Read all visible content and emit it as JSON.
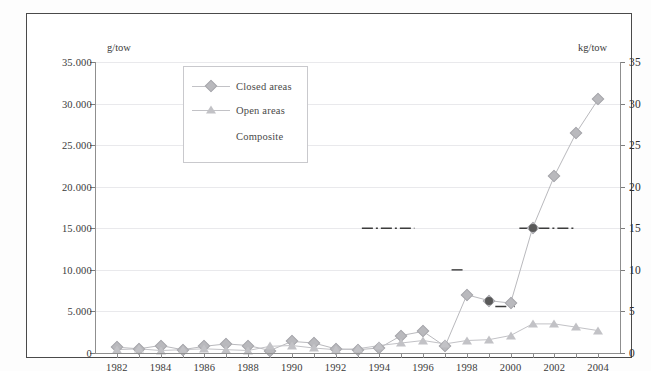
{
  "axes": {
    "left_unit": "g/tow",
    "right_unit": "kg/tow",
    "left_ticks": [
      "35.000",
      "30.000",
      "25.000",
      "20.000",
      "15.000",
      "10.000",
      "5.000",
      "0"
    ],
    "right_ticks": [
      "35",
      "30",
      "25",
      "20",
      "15",
      "10",
      "5",
      "0"
    ],
    "x_labels": [
      "1982",
      "1984",
      "1986",
      "1988",
      "1990",
      "1992",
      "1994",
      "1996",
      "1998",
      "2000",
      "2002",
      "2004"
    ]
  },
  "legend": {
    "position": "upper-left-inset",
    "items": [
      {
        "label": "Closed areas",
        "marker": "diamond",
        "color": "#b9b9bd"
      },
      {
        "label": "Open areas",
        "marker": "triangle",
        "color": "#c2c2c6"
      },
      {
        "label": "Composite",
        "marker": "dash-dot-line",
        "color": "#3c3c3c"
      }
    ]
  },
  "chart_data": {
    "type": "line",
    "title": "",
    "xlabel": "",
    "ylabel": "g/tow",
    "y2label": "kg/tow",
    "xlim": [
      1981,
      2005
    ],
    "ylim": [
      0,
      35
    ],
    "y2lim": [
      0,
      35
    ],
    "grid": true,
    "x": [
      1982,
      1983,
      1984,
      1985,
      1986,
      1987,
      1988,
      1989,
      1990,
      1991,
      1992,
      1993,
      1994,
      1995,
      1996,
      1997,
      1998,
      1999,
      2000,
      2001,
      2002,
      2003,
      2004
    ],
    "series": [
      {
        "name": "Closed areas",
        "marker": "diamond",
        "color": "#b9b9bd",
        "values": [
          0.7,
          0.5,
          0.9,
          0.4,
          0.8,
          1.1,
          0.9,
          0.3,
          1.4,
          1.2,
          0.5,
          0.4,
          0.6,
          2.1,
          2.6,
          0.8,
          7.0,
          6.3,
          6.0,
          15.0,
          21.3,
          26.5,
          30.5
        ]
      },
      {
        "name": "Open areas",
        "marker": "triangle",
        "color": "#c2c2c6",
        "values": [
          0.4,
          0.5,
          0.3,
          0.4,
          0.5,
          0.4,
          0.3,
          0.8,
          0.9,
          0.6,
          0.4,
          0.5,
          0.9,
          1.2,
          1.5,
          1.1,
          1.5,
          1.6,
          2.1,
          3.5,
          3.5,
          3.1,
          2.7
        ]
      },
      {
        "name": "Composite",
        "marker": "none",
        "line": "dash-dot",
        "color": "#3c3c3c",
        "segments": [
          {
            "x": [
              1993.2,
              1995.6
            ],
            "y": [
              15.0,
              15.0
            ]
          },
          {
            "x": [
              1997.3,
              1997.9
            ],
            "y": [
              10.0,
              10.0
            ]
          },
          {
            "x": [
              1999.3,
              2000.2
            ],
            "y": [
              5.6,
              5.6
            ]
          },
          {
            "x": [
              2000.4,
              2003.0
            ],
            "y": [
              15.0,
              15.0
            ]
          }
        ]
      }
    ]
  }
}
